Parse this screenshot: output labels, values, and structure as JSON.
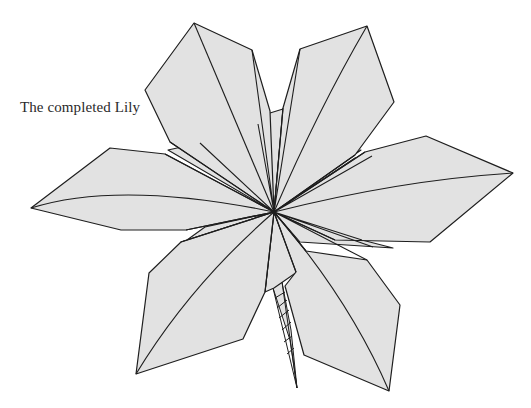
{
  "figure": {
    "caption": "The completed Lily",
    "colors": {
      "fill": "#e2e2e2",
      "stroke": "#1e1e1e",
      "background": "#ffffff"
    },
    "center": [
      274,
      212
    ],
    "petals": [
      {
        "name": "top-left",
        "tip": [
          194,
          23
        ]
      },
      {
        "name": "top-right",
        "tip": [
          367,
          26
        ]
      },
      {
        "name": "right",
        "tip": [
          513,
          173
        ]
      },
      {
        "name": "bottom-right",
        "tip": [
          389,
          391
        ]
      },
      {
        "name": "bottom-left",
        "tip": [
          136,
          374
        ]
      },
      {
        "name": "left",
        "tip": [
          31,
          208
        ]
      }
    ],
    "stem": {
      "top": [
        273,
        288
      ],
      "bottom": [
        297,
        388
      ]
    }
  }
}
